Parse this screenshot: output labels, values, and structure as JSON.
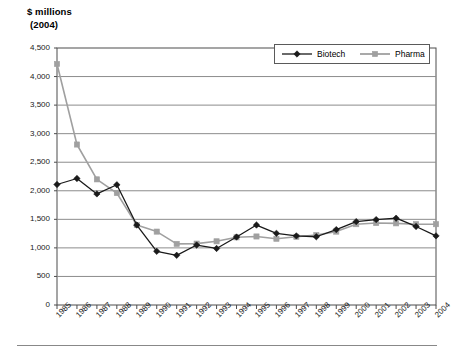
{
  "axis_titles": {
    "line1": "$ millions",
    "line2": "(2004)"
  },
  "legend": {
    "items": [
      {
        "label": "Biotech",
        "color": "#1a1a1a",
        "marker": "diamond"
      },
      {
        "label": "Pharma",
        "color": "#a0a0a0",
        "marker": "square"
      }
    ]
  },
  "colors": {
    "biotech": "#1a1a1a",
    "pharma": "#a0a0a0",
    "grid": "#8c8c8c",
    "axis": "#4d4d4d",
    "background": "#ffffff"
  },
  "chart_data": {
    "type": "line",
    "title": "$ millions (2004)",
    "xlabel": "",
    "ylabel": "$ millions (2004)",
    "ylim": [
      0,
      4500
    ],
    "ytick_labels": [
      "4,500",
      "4,000",
      "3,500",
      "3,000",
      "2,500",
      "2,000",
      "1,500",
      "1,000",
      "500",
      "0"
    ],
    "yticks": [
      4500,
      4000,
      3500,
      3000,
      2500,
      2000,
      1500,
      1000,
      500,
      0
    ],
    "grid": true,
    "legend_position": "top-right",
    "categories": [
      "1985",
      "1986",
      "1987",
      "1988",
      "1989",
      "1990",
      "1991",
      "1992",
      "1993",
      "1994",
      "1995",
      "1996",
      "1997",
      "1998",
      "1999",
      "2000",
      "2001",
      "2002",
      "2003",
      "2004"
    ],
    "series": [
      {
        "name": "Biotech",
        "color": "#1a1a1a",
        "marker": "diamond",
        "values": [
          2110,
          2215,
          1945,
          2105,
          1400,
          940,
          870,
          1050,
          990,
          1190,
          1400,
          1255,
          1210,
          1195,
          1320,
          1460,
          1495,
          1520,
          1375,
          1210
        ]
      },
      {
        "name": "Pharma",
        "color": "#a0a0a0",
        "marker": "square",
        "values": [
          4220,
          2810,
          2200,
          1960,
          1400,
          1285,
          1070,
          1075,
          1115,
          1185,
          1200,
          1160,
          1195,
          1225,
          1285,
          1415,
          1435,
          1430,
          1415,
          1415
        ]
      }
    ]
  }
}
